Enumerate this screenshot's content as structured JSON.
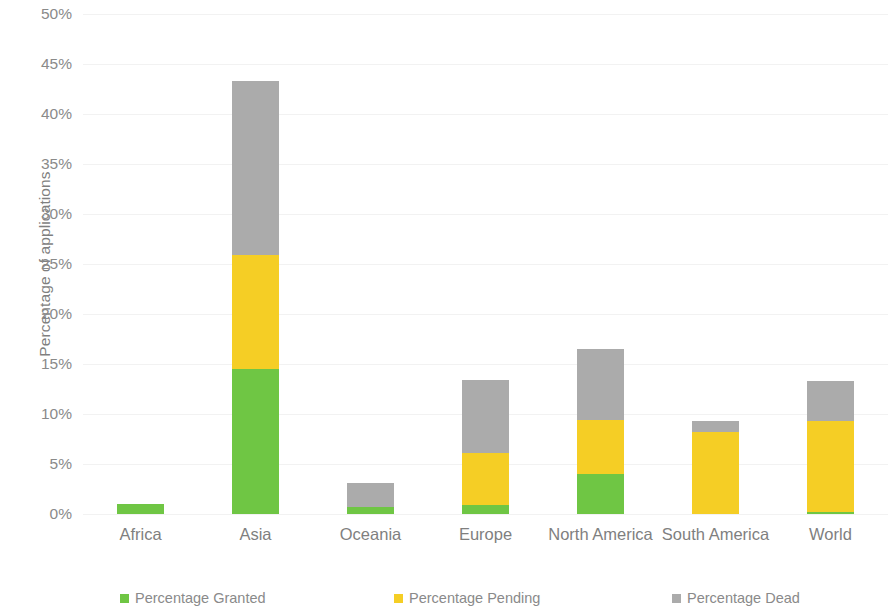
{
  "chart_data": {
    "type": "bar",
    "subtype": "stacked-bar",
    "title": "",
    "subtitle": "",
    "xlabel": "",
    "ylabel": "Percentage of applications",
    "ylim": [
      0,
      50
    ],
    "ytick_values": [
      0,
      5,
      10,
      15,
      20,
      25,
      30,
      35,
      40,
      45,
      50
    ],
    "ytick_labels": [
      "0%",
      "5%",
      "10%",
      "15%",
      "20%",
      "25%",
      "30%",
      "35%",
      "40%",
      "45%",
      "50%"
    ],
    "grid": true,
    "grid_axis": "y",
    "legend_position": "bottom",
    "categories": [
      "Africa",
      "Asia",
      "Oceania",
      "Europe",
      "North America",
      "South America",
      "World"
    ],
    "series": [
      {
        "name": "Percentage Granted",
        "color": "#6FC644",
        "values": [
          1.0,
          14.5,
          0.7,
          0.9,
          4.0,
          0.0,
          0.2
        ]
      },
      {
        "name": "Percentage Pending",
        "color": "#F5CE25",
        "values": [
          0.0,
          11.4,
          0.0,
          5.2,
          5.4,
          8.2,
          9.1
        ]
      },
      {
        "name": "Percentage Dead",
        "color": "#ABABAB",
        "values": [
          0.0,
          17.4,
          2.4,
          7.3,
          7.1,
          1.1,
          4.0
        ]
      }
    ],
    "totals": [
      1.0,
      43.3,
      3.1,
      13.4,
      16.5,
      9.3,
      13.3
    ]
  },
  "legend": {
    "items": [
      {
        "label": "Percentage Granted",
        "color": "#6FC644"
      },
      {
        "label": "Percentage Pending",
        "color": "#F5CE25"
      },
      {
        "label": "Percentage Dead",
        "color": "#ABABAB"
      }
    ]
  },
  "axes": {
    "y_title": "Percentage of applications"
  },
  "colors": {
    "granted": "#6FC644",
    "pending": "#F5CE25",
    "dead": "#ABABAB",
    "gridline": "#F2F2F2",
    "text": "#7F7F7F",
    "background": "#FFFFFF"
  }
}
